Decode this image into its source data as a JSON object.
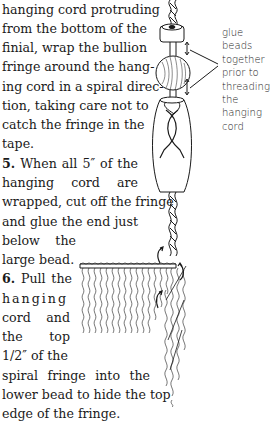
{
  "instructions": {
    "intro_lines": [
      "hanging cord protruding",
      "from the bottom of the",
      "finial, wrap the bullion",
      "fringe around the hang-",
      "ing cord in a spiral direc-",
      "tion, taking care not to",
      "catch the fringe in the",
      "tape."
    ],
    "step5": {
      "number": "5.",
      "lines": [
        "When all 5″ of the",
        "hanging cord are",
        "wrapped, cut off the fringe",
        "and glue the end just",
        "below the",
        "large bead."
      ]
    },
    "step6": {
      "number": "6.",
      "lines": [
        "Pull the",
        "hanging",
        "cord and",
        "the top",
        "1/2″ of the",
        "spiral fringe into the",
        "lower bead to hide the top",
        "edge of the fringe."
      ]
    }
  },
  "illustration": {
    "annotation_lines": [
      "glue beads",
      "together",
      "prior to",
      "threading",
      "the hanging",
      "cord"
    ],
    "ink_color": "#1a1a1a"
  }
}
